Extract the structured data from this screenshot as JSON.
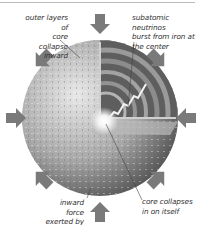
{
  "diagram": {
    "labels": {
      "outer_layers": "outer layers of core collapse inward",
      "outer_layers_lines": [
        "outer layers of",
        "core collapse",
        "inward"
      ],
      "neutrinos_lines": [
        "subatomic neutrinos",
        "burst from iron at",
        "the center"
      ],
      "gravity_lines": [
        "inward force",
        "exerted by gravity"
      ],
      "core_lines": [
        "core collapses",
        "in on itself"
      ]
    },
    "arrows": {
      "count": 8,
      "direction": "inward",
      "color": "#7a7a7a"
    },
    "colors": {
      "sphere_light": "#d9d9d9",
      "sphere_dark": "#6b6b6b",
      "core_glow": "#ffffff",
      "arrow": "#7a7a7a",
      "text": "#333333"
    }
  }
}
